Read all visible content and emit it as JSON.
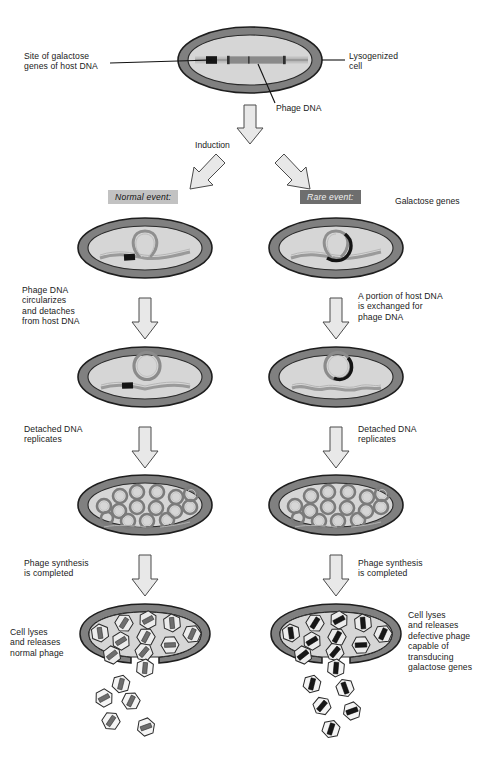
{
  "diagram": {
    "colors": {
      "cell_wall": "#808080",
      "cell_wall_dark": "#5e5e5e",
      "cytoplasm": "#d4d4d4",
      "cytoplasm_light": "#dedede",
      "dna_strand": "#8f8f8f",
      "gal_genes_dark": "#141414",
      "phage_head_fill": "#ececec",
      "phage_dna_normal": "#6b6b6b",
      "phage_dna_defective": "#171717",
      "arrow_fill": "#e8e8e8",
      "arrow_stroke": "#4a4a4a",
      "badge_normal_bg": "#c2c2c2",
      "badge_rare_bg": "#6e6e6e",
      "outline": "#222222",
      "text": "#1a1a1a"
    },
    "labels": {
      "site_of_galactose_genes": "Site of galactose\ngenes of host DNA",
      "lysogenized_cell": "Lysogenized\ncell",
      "phage_dna": "Phage DNA",
      "induction": "Induction",
      "normal_event": "Normal event:",
      "rare_event": "Rare event:",
      "galactose_genes": "Galactose genes",
      "left_step_1": "Phage DNA\ncircularizes\nand detaches\nfrom host DNA",
      "right_step_1": "A portion of host DNA\nis exchanged for\nphage DNA",
      "left_step_2": "Detached DNA\nreplicates",
      "right_step_2": "Detached DNA\nreplicates",
      "left_step_3": "Phage synthesis\nis completed",
      "right_step_3": "Phage synthesis\nis completed",
      "left_step_4": "Cell lyses\nand releases\nnormal phage",
      "right_step_4": "Cell lyses\nand releases\ndefective phage\ncapable of\ntransducing\ngalactose genes"
    },
    "stages": {
      "top_cell": {
        "name": "lysogenized-cell",
        "description": "Host cell containing host DNA with integrated phage DNA and galactose gene site"
      },
      "branch_left": {
        "name": "normal-event-cell",
        "description": "Phage DNA loops out of host chromosome leaving galactose genes behind"
      },
      "branch_right": {
        "name": "rare-event-cell",
        "description": "Phage DNA loops out carrying galactose genes exchanged for phage DNA"
      },
      "detach_left": {
        "name": "normal-detached-cell",
        "description": "Circular phage DNA detached; host DNA retains galactose genes"
      },
      "detach_right": {
        "name": "rare-detached-cell",
        "description": "Circular DNA containing galactose genes detached; host DNA lacks segment"
      },
      "replicate_left": {
        "name": "normal-replication-cell",
        "circle_count": 15
      },
      "replicate_right": {
        "name": "rare-replication-cell",
        "circle_count": 15
      },
      "lysis_left": {
        "name": "normal-lysis-cell",
        "phage_inside": 10,
        "phage_released": 6,
        "phage_type": "normal phage"
      },
      "lysis_right": {
        "name": "defective-lysis-cell",
        "phage_inside": 10,
        "phage_released": 6,
        "phage_type": "defective transducing phage"
      }
    }
  }
}
